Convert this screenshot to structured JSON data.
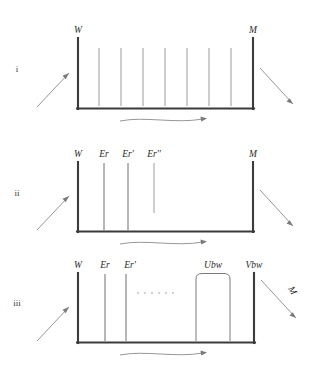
{
  "figure": {
    "background_color": "#ffffff",
    "line_color": "#3b3b3b",
    "divider_color": "#8e8e8e",
    "arrow_color": "#8a8a8a",
    "panel_count": 3
  },
  "panels": [
    {
      "id": "panel-i",
      "roman_label": "i",
      "left_label": "W",
      "right_label": "M",
      "divider_count": 7,
      "has_dots": false,
      "has_bump": false,
      "inner_labels": [],
      "in_arrow": "diagonal-up-right",
      "out_arrow": "diagonal-down-right",
      "flow_arrow": "rightward-under-floor"
    },
    {
      "id": "panel-ii",
      "roman_label": "ii",
      "left_label": "W",
      "right_label": "M",
      "divider_count": 3,
      "has_dots": false,
      "has_bump": false,
      "inner_labels": [
        "Er",
        "Er'",
        "Er''"
      ],
      "in_arrow": "diagonal-up-right",
      "out_arrow": "diagonal-down-right",
      "flow_arrow": "rightward-under-floor"
    },
    {
      "id": "panel-iii",
      "roman_label": "iii",
      "left_label": "W",
      "right_label": "Vbw",
      "divider_count": 2,
      "has_dots": true,
      "has_bump": true,
      "inner_labels": [
        "Er",
        "Er'"
      ],
      "bump_label": "Ubw",
      "slant_label": "M",
      "in_arrow": "diagonal-up-right",
      "out_arrow": "diagonal-down-right",
      "flow_arrow": "rightward-under-floor"
    }
  ],
  "labels": {
    "W": "W",
    "M": "M",
    "Er": "Er",
    "Er_prime": "Er'",
    "Er_double_prime": "Er''",
    "Ubw": "Ubw",
    "Vbw": "Vbw",
    "roman_i": "i",
    "roman_ii": "ii",
    "roman_iii": "iii"
  }
}
